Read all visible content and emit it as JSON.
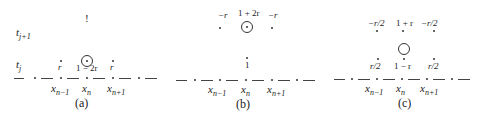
{
  "figure": {
    "panels": [
      {
        "caption": "(a)",
        "row_labels": {
          "upper": "t",
          "upper_sub": "j+1",
          "lower": "t",
          "lower_sub": "j"
        },
        "x_labels": [
          {
            "base": "x",
            "sub": "n−1"
          },
          {
            "base": "x",
            "sub": "n"
          },
          {
            "base": "x",
            "sub": "n+1"
          }
        ],
        "upper_marker": "!",
        "weights": [
          "r",
          "1 − 2r",
          "r"
        ]
      },
      {
        "caption": "(b)",
        "x_labels": [
          {
            "base": "x",
            "sub": "n−1"
          },
          {
            "base": "x",
            "sub": "n"
          },
          {
            "base": "x",
            "sub": "n+1"
          }
        ],
        "lower_marker": "1",
        "weights": [
          "−r",
          "1 + 2r",
          "−r"
        ]
      },
      {
        "caption": "(c)",
        "x_labels": [
          {
            "base": "x",
            "sub": "n−1"
          },
          {
            "base": "x",
            "sub": "n"
          },
          {
            "base": "x",
            "sub": "n+1"
          }
        ],
        "upper_weights": [
          "−r/2",
          "1 + r",
          "−r/2"
        ],
        "lower_weights": [
          "r/2",
          "1 − r",
          "r/2"
        ]
      }
    ]
  }
}
